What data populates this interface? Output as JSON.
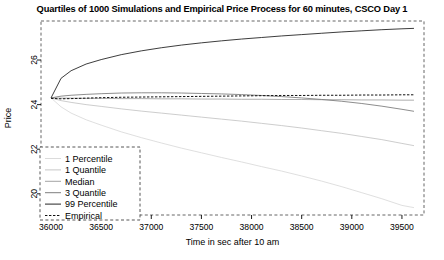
{
  "chart_data": {
    "type": "line",
    "title": "Quartiles of 1000 Simulations and Empirical Price Process for 60 minutes, CSCO Day 1",
    "xlabel": "Time in sec after 10 am",
    "ylabel": "Price",
    "xlim": [
      35900,
      39720
    ],
    "ylim": [
      19.05,
      27.75
    ],
    "xticks": [
      36000,
      36500,
      37000,
      37500,
      38000,
      38500,
      39000,
      39500
    ],
    "yticks": [
      20,
      22,
      24,
      26
    ],
    "grid": false,
    "legend_position": "bottom-left",
    "frame": "dashed",
    "x": [
      36000,
      36100,
      36200,
      36350,
      36500,
      36700,
      36900,
      37100,
      37300,
      37500,
      37700,
      37900,
      38100,
      38300,
      38500,
      38700,
      38900,
      39100,
      39300,
      39500,
      39620
    ],
    "series": [
      {
        "name": "1 Percentile",
        "color": "#d9d9d9",
        "style": "solid",
        "values": [
          24.3,
          23.9,
          23.62,
          23.32,
          23.08,
          22.78,
          22.52,
          22.28,
          22.05,
          21.84,
          21.63,
          21.43,
          21.22,
          21.02,
          20.8,
          20.57,
          20.32,
          20.05,
          19.78,
          19.48,
          19.38
        ]
      },
      {
        "name": "1 Quantile",
        "color": "#c4c4c4",
        "style": "solid",
        "values": [
          24.3,
          24.18,
          24.1,
          24.0,
          23.92,
          23.81,
          23.71,
          23.62,
          23.53,
          23.44,
          23.35,
          23.26,
          23.16,
          23.06,
          22.95,
          22.83,
          22.71,
          22.57,
          22.43,
          22.26,
          22.16
        ]
      },
      {
        "name": "Median",
        "color": "#9e9e9e",
        "style": "solid",
        "values": [
          24.3,
          24.29,
          24.29,
          24.28,
          24.28,
          24.27,
          24.27,
          24.26,
          24.26,
          24.25,
          24.25,
          24.24,
          24.24,
          24.23,
          24.23,
          24.22,
          24.22,
          24.21,
          24.21,
          24.2,
          24.2
        ]
      },
      {
        "name": "3 Quantile",
        "color": "#787878",
        "style": "solid",
        "values": [
          24.3,
          24.38,
          24.42,
          24.46,
          24.49,
          24.52,
          24.53,
          24.53,
          24.52,
          24.5,
          24.48,
          24.45,
          24.41,
          24.36,
          24.3,
          24.23,
          24.15,
          24.05,
          23.93,
          23.79,
          23.7
        ]
      },
      {
        "name": "99 Percentile",
        "color": "#1a1a1a",
        "style": "solid",
        "values": [
          24.3,
          25.18,
          25.52,
          25.82,
          26.02,
          26.24,
          26.41,
          26.55,
          26.67,
          26.77,
          26.86,
          26.94,
          27.01,
          27.08,
          27.14,
          27.2,
          27.26,
          27.31,
          27.36,
          27.4,
          27.42
        ]
      },
      {
        "name": "Empirical",
        "color": "#111111",
        "style": "dashed",
        "values": [
          24.28,
          24.26,
          24.27,
          24.29,
          24.31,
          24.33,
          24.34,
          24.35,
          24.36,
          24.37,
          24.38,
          24.39,
          24.4,
          24.41,
          24.41,
          24.42,
          24.42,
          24.43,
          24.43,
          24.44,
          24.44
        ]
      }
    ]
  },
  "legend": {
    "items": [
      {
        "label": "1 Percentile"
      },
      {
        "label": "1 Quantile"
      },
      {
        "label": "Median"
      },
      {
        "label": "3 Quantile"
      },
      {
        "label": "99 Percentile"
      },
      {
        "label": "Empirical"
      }
    ]
  }
}
